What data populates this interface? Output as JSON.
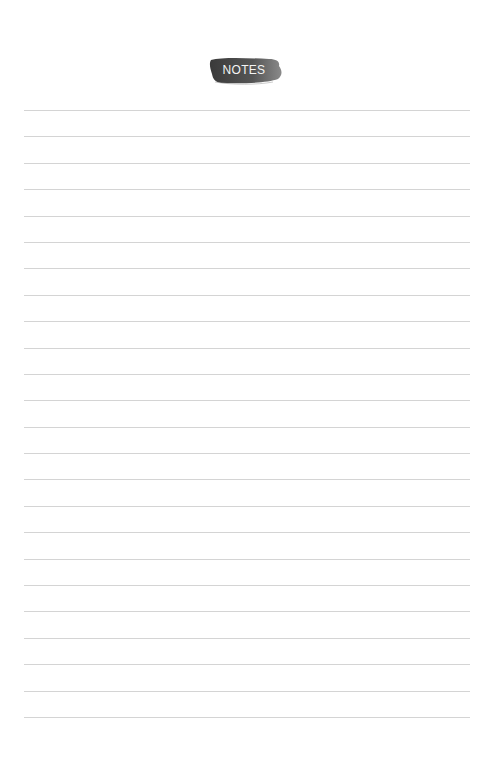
{
  "page": {
    "title": "NOTES",
    "line_count": 24,
    "line_color": "#d4d4d4",
    "brush_color": "#4a4a4a"
  }
}
